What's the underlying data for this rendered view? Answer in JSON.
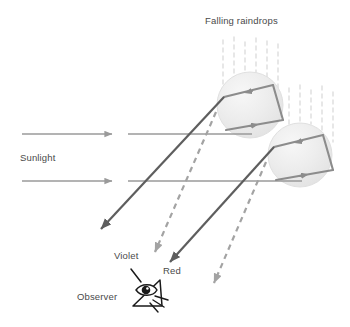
{
  "figure": {
    "title": "Falling raindrops",
    "width": 350,
    "height": 327,
    "background": "#ffffff"
  },
  "labels": {
    "falling_raindrops": "Falling raindrops",
    "sunlight": "Sunlight",
    "violet": "Violet",
    "red": "Red",
    "observer": "Observer"
  },
  "colors": {
    "text": "#4a4a4a",
    "sunlight_ray": "#9a9a9a",
    "solid_ray": "#5e5e5e",
    "dashed_ray": "#a3a3a3",
    "internal_ray": "#8c8c8c",
    "droplet_fill": "#ececec",
    "droplet_edge": "#e0e0e0",
    "rain_streak": "#e2e2e2",
    "observer_ink": "#1a1a1a"
  },
  "icons": {
    "observer_eye": "eye-icon",
    "sun_arrow": "arrow-right-icon",
    "violet_arrow": "dashed-arrow-icon",
    "red_arrow": "solid-arrow-icon"
  },
  "geometry": {
    "droplets": [
      {
        "name": "upper-raindrop",
        "cx": 250,
        "cy": 105,
        "r": 33
      },
      {
        "name": "lower-raindrop",
        "cx": 300,
        "cy": 155,
        "r": 32
      }
    ],
    "sunlight_rays": [
      {
        "name": "sunlight-ray-upper",
        "y": 134,
        "x1": 22,
        "x2": 118
      },
      {
        "name": "sunlight-ray-lower",
        "y": 181,
        "x1": 22,
        "x2": 118
      }
    ],
    "horizontal_continuations": [
      {
        "name": "continuation-upper",
        "y": 134,
        "x1": 128,
        "x2": 250
      },
      {
        "name": "continuation-lower",
        "y": 181,
        "x1": 128,
        "x2": 300
      }
    ],
    "rain_streak_groups": [
      {
        "name": "rain-streaks-upper",
        "x_start": 222,
        "count": 6,
        "spacing": 11,
        "y_top": 38,
        "y_bottom": 92
      },
      {
        "name": "rain-streaks-lower",
        "x_start": 288,
        "count": 5,
        "spacing": 11,
        "y_top": 84,
        "y_bottom": 140
      }
    ],
    "red_rays": [
      {
        "name": "red-ray-upper",
        "x1": 222,
        "y1": 98,
        "x2": 96,
        "y2": 234
      },
      {
        "name": "red-ray-lower",
        "x1": 272,
        "y1": 148,
        "x2": 165,
        "y2": 267
      }
    ],
    "violet_rays": [
      {
        "name": "violet-ray-upper",
        "x1": 216,
        "y1": 112,
        "x2": 152,
        "y2": 258
      },
      {
        "name": "violet-ray-lower",
        "x1": 266,
        "y1": 162,
        "x2": 212,
        "y2": 290
      }
    ],
    "observer_eye": {
      "cx": 146,
      "cy": 291
    }
  }
}
